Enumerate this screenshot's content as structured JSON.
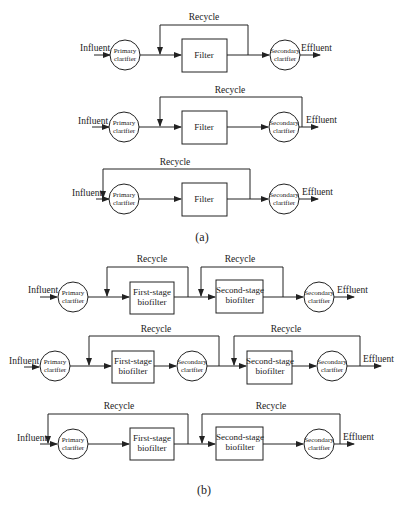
{
  "figure_a": {
    "caption": "(a)",
    "rows": [
      {
        "influent": "Influent",
        "primary": [
          "Primary",
          "clarifier"
        ],
        "filter": "Filter",
        "secondary": [
          "Secondary",
          "clarifier"
        ],
        "effluent": "Effluent",
        "recycle": "Recycle"
      },
      {
        "influent": "Influent",
        "primary": [
          "Primary",
          "clarifier"
        ],
        "filter": "Filter",
        "secondary": [
          "Secondary",
          "clarifier"
        ],
        "effluent": "Effluent",
        "recycle": "Recycle"
      },
      {
        "influent": "Influent",
        "primary": [
          "Primary",
          "clarifier"
        ],
        "filter": "Filter",
        "secondary": [
          "Secondary",
          "clarifier"
        ],
        "effluent": "Effluent",
        "recycle": "Recycle"
      }
    ]
  },
  "figure_b": {
    "caption": "(b)",
    "rows": [
      {
        "influent": "Influent",
        "primary": [
          "Primary",
          "clarifier"
        ],
        "stage1": [
          "First-stage",
          "biofilter"
        ],
        "stage2": [
          "Second-stage",
          "biofilter"
        ],
        "secondary": [
          "Secondary",
          "clarifier"
        ],
        "effluent": "Effluent",
        "recycle1": "Recycle",
        "recycle2": "Recycle"
      },
      {
        "influent": "Influent",
        "primary": [
          "Primary",
          "clarifier"
        ],
        "stage1": [
          "First-stage",
          "biofilter"
        ],
        "intermediate": [
          "Secondary",
          "clarifier"
        ],
        "stage2": [
          "Second-stage",
          "biofilter"
        ],
        "secondary": [
          "Secondary",
          "clarifier"
        ],
        "effluent": "Effluent",
        "recycle1": "Recycle",
        "recycle2": "Recycle"
      },
      {
        "influent": "Influent",
        "primary": [
          "Primary",
          "clarifier"
        ],
        "stage1": [
          "First-stage",
          "biofilter"
        ],
        "stage2": [
          "Second-stage",
          "biofilter"
        ],
        "secondary": [
          "Secondary",
          "clarifier"
        ],
        "effluent": "Effluent",
        "recycle1": "Recycle",
        "recycle2": "Recycle"
      }
    ]
  }
}
